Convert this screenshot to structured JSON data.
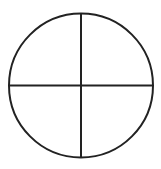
{
  "diagram": {
    "canvas": {
      "width": 161,
      "height": 169
    },
    "background": "#ffffff",
    "stroke_color": "#222222",
    "stroke_width": 2,
    "circle": {
      "cx": 81,
      "cy": 85.5,
      "r": 72
    },
    "vertical_line": {
      "x1": 81,
      "y1": 13.5,
      "x2": 81,
      "y2": 157.5
    },
    "horizontal_line": {
      "x1": 9,
      "y1": 85.5,
      "x2": 153,
      "y2": 85.5
    },
    "quadrants": 4
  }
}
